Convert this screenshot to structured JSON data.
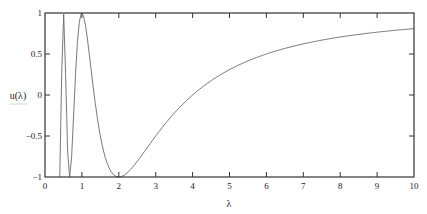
{
  "chart_data": {
    "type": "line",
    "title": "",
    "xlabel": "λ",
    "ylabel": "u(λ)",
    "xlim": [
      0,
      10
    ],
    "ylim": [
      -1,
      1
    ],
    "grid": false,
    "legend": null,
    "x_ticks": [
      0,
      1,
      2,
      3,
      4,
      5,
      6,
      7,
      8,
      9,
      10
    ],
    "y_ticks": [
      1,
      0.5,
      0,
      -0.5,
      -1
    ],
    "y_tick_labels": [
      "1",
      "0.5",
      "0",
      "−0.5",
      "−1"
    ],
    "series": [
      {
        "name": "u(λ)",
        "function": "cos(2π/λ)",
        "color": "#6a6a6a",
        "x": [
          0.4,
          0.5,
          0.667,
          1.0,
          1.25,
          1.5,
          1.75,
          2.0,
          2.5,
          3.0,
          3.5,
          4.0,
          5.0,
          6.0,
          7.0,
          8.0,
          9.0,
          10.0
        ],
        "values": [
          -1.0,
          1.0,
          -1.0,
          1.0,
          -0.81,
          0.0,
          -0.62,
          -1.0,
          -0.81,
          -0.5,
          -0.22,
          0.0,
          0.31,
          0.5,
          0.63,
          0.71,
          0.77,
          0.81
        ]
      }
    ]
  },
  "colors": {
    "frame": "#333333",
    "curve": "#6a6a6a",
    "background": "#ffffff"
  }
}
